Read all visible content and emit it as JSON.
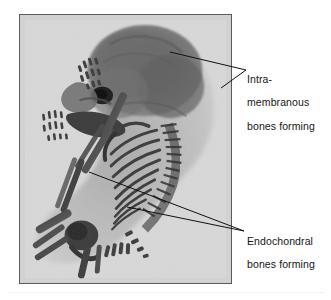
{
  "figure": {
    "kind": "annotated-photograph",
    "background_color": "#ffffff"
  },
  "photo": {
    "name": "skeleton-photograph",
    "frame_border_color": "#5a5a5a",
    "background_color": "#d9d9d9",
    "bone_stain_color": "#4a4a4a",
    "cartilage_tone": "#b9b9b9",
    "regions": [
      "skull-vault",
      "orbit",
      "mandible",
      "forelimb",
      "digits",
      "ribcage",
      "vertebral-column",
      "pelvis",
      "hindlimb"
    ]
  },
  "labels": [
    {
      "id": "intramembranous",
      "lines": [
        "Intra-",
        "membranous",
        "bones forming"
      ],
      "text_color": "#141414",
      "arrow_tip": {
        "x": 246,
        "y": 70
      },
      "targets": [
        {
          "x": 170,
          "y": 52
        },
        {
          "x": 221,
          "y": 88
        }
      ]
    },
    {
      "id": "endochondral",
      "lines": [
        "Endochondral",
        "bones forming"
      ],
      "text_color": "#141414",
      "arrow_tip": {
        "x": 244,
        "y": 231
      },
      "targets": [
        {
          "x": 89,
          "y": 172
        },
        {
          "x": 127,
          "y": 207
        }
      ]
    }
  ],
  "leader_line_color": "#101010",
  "bottom_rule_color": "#f2f2f2"
}
